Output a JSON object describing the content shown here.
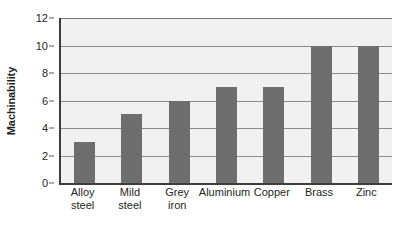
{
  "chart_data": {
    "type": "bar",
    "title": "",
    "xlabel": "",
    "ylabel": "Machinability",
    "categories": [
      "Alloy steel",
      "Mild steel",
      "Grey iron",
      "Aluminium",
      "Copper",
      "Brass",
      "Zinc"
    ],
    "category_lines": [
      [
        "Alloy",
        "steel"
      ],
      [
        "Mild",
        "steel"
      ],
      [
        "Grey",
        "iron"
      ],
      [
        "Aluminium",
        ""
      ],
      [
        "Copper",
        ""
      ],
      [
        "Brass",
        ""
      ],
      [
        "Zinc",
        ""
      ]
    ],
    "values": [
      3,
      5,
      6,
      7,
      7,
      10,
      10
    ],
    "ylim": [
      0,
      12
    ],
    "ytick_labels": [
      "0",
      "2",
      "4",
      "6",
      "8",
      "10",
      "12"
    ],
    "ytick_values": [
      0,
      2,
      4,
      6,
      8,
      10,
      12
    ],
    "grid": true,
    "grid_axis": "y",
    "legend": "none",
    "colors": {
      "bar_fill": "#6e6e6e",
      "plot_background": "#f1f1f1",
      "gridline": "#8a8a8a",
      "axis_line": "#3d3d3d",
      "text": "#231f20",
      "page_background": "#ffffff"
    }
  }
}
